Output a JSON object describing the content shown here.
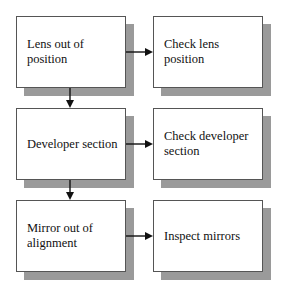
{
  "diagram": {
    "type": "flowchart",
    "colors": {
      "box_fill": "#ffffff",
      "box_border": "#555555",
      "shadow": "#9a9a9a",
      "arrow": "#111111"
    },
    "left_column": [
      {
        "id": "lens-out-of-position",
        "label": "Lens out of position"
      },
      {
        "id": "developer-section",
        "label": "Developer section"
      },
      {
        "id": "mirror-out-of-alignment",
        "label": "Mirror out of alignment"
      }
    ],
    "right_column": [
      {
        "id": "check-lens-position",
        "label": "Check lens position"
      },
      {
        "id": "check-developer-section",
        "label": "Check developer section"
      },
      {
        "id": "inspect-mirrors",
        "label": "Inspect mirrors"
      }
    ],
    "edges": [
      {
        "from": "lens-out-of-position",
        "to": "check-lens-position"
      },
      {
        "from": "lens-out-of-position",
        "to": "developer-section"
      },
      {
        "from": "developer-section",
        "to": "check-developer-section"
      },
      {
        "from": "developer-section",
        "to": "mirror-out-of-alignment"
      },
      {
        "from": "mirror-out-of-alignment",
        "to": "inspect-mirrors"
      }
    ]
  }
}
